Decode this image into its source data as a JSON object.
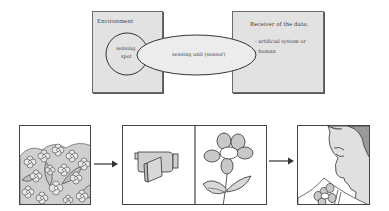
{
  "diagram": {
    "top": {
      "environment_box": {
        "label": "Environment"
      },
      "sensing_spot": {
        "line1": "sensing",
        "line2": "spot"
      },
      "sensing_unit": {
        "label": "sensing unit (sensor)"
      },
      "receiver_box": {
        "label": "Receiver of the data:",
        "items": [
          "- artificial system or",
          "- human"
        ]
      }
    },
    "bottom": {
      "panels": [
        {
          "name": "flower-field",
          "description": "field of many flowers and leaves"
        },
        {
          "name": "camera-and-flower",
          "description": "video camera sensing a single flower"
        },
        {
          "name": "human-smelling-flower",
          "description": "person smelling a flower bouquet"
        }
      ],
      "arrows": [
        "field-to-sensor",
        "sensor-to-human"
      ]
    },
    "colors": {
      "box_fill": "#e2e2e2",
      "border": "#444444",
      "shape_fill": "#d0d0d0",
      "ellipse_fill": "#ececec"
    }
  }
}
